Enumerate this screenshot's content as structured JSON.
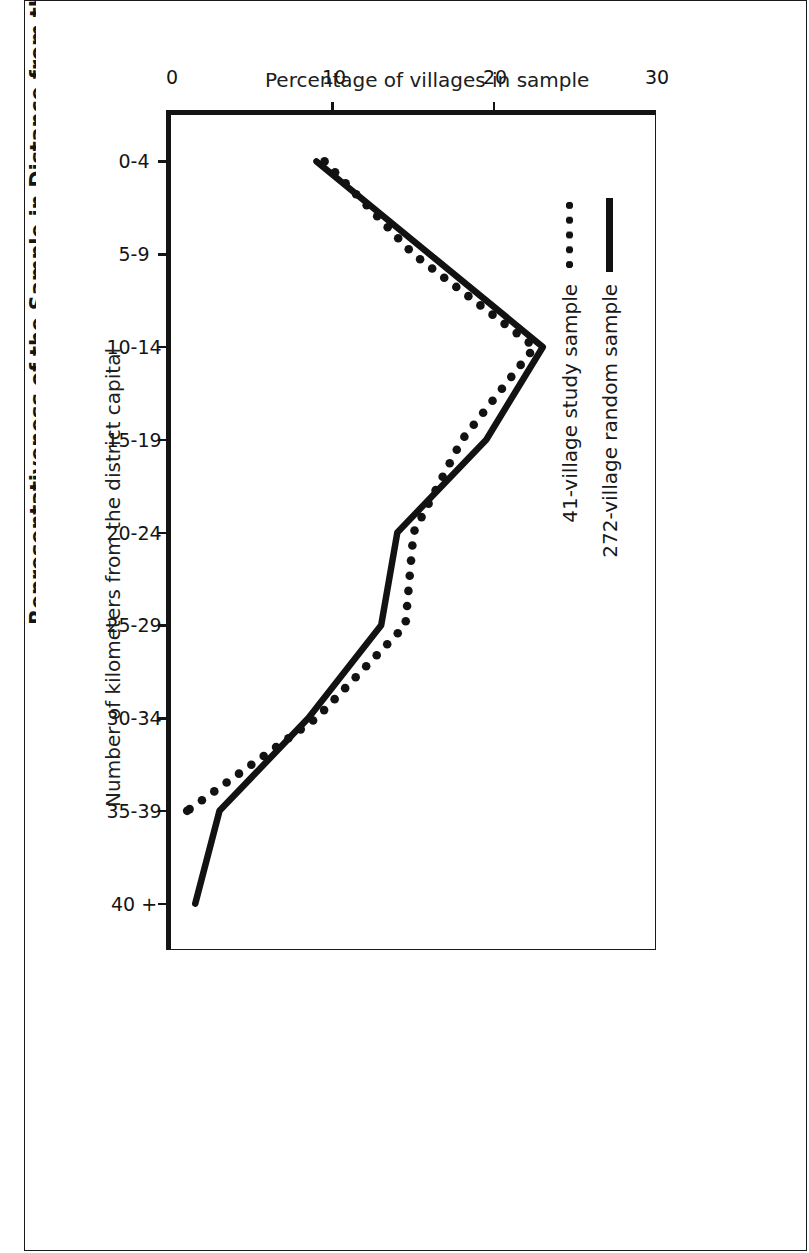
{
  "figure": {
    "title": "Representativeness of the Sample in Distance from the District Capital"
  },
  "legend": {
    "items": [
      {
        "label": "272-village random sample",
        "marker": "solid-line-swatch"
      },
      {
        "label": "41-village study sample",
        "marker": "dotted-line-swatch"
      }
    ]
  },
  "chart_data": {
    "type": "line",
    "title": "Representativeness of the Sample in Distance from the District Capital",
    "xlabel": "Number of kilometers from the district capital",
    "ylabel": "Percentage of villages in sample",
    "categories": [
      "0-4",
      "5-9",
      "10-14",
      "15-19",
      "20-24",
      "25-29",
      "30-34",
      "35-39",
      "40 +"
    ],
    "ylim": [
      0,
      30
    ],
    "yticks": [
      0,
      10,
      20,
      30
    ],
    "ytick_labels": [
      "0",
      "10",
      "20",
      "30"
    ],
    "grid": false,
    "legend_position": "top-left",
    "orientation": "rotated-90-clockwise",
    "series": [
      {
        "name": "272-village random sample",
        "style": "solid",
        "values": [
          9,
          16,
          23,
          19.5,
          14,
          13,
          8.5,
          3,
          1.5
        ]
      },
      {
        "name": "41-village study sample",
        "style": "dotted",
        "values": [
          9.5,
          15,
          22.5,
          18,
          15,
          14.5,
          9,
          1,
          null
        ]
      }
    ]
  }
}
